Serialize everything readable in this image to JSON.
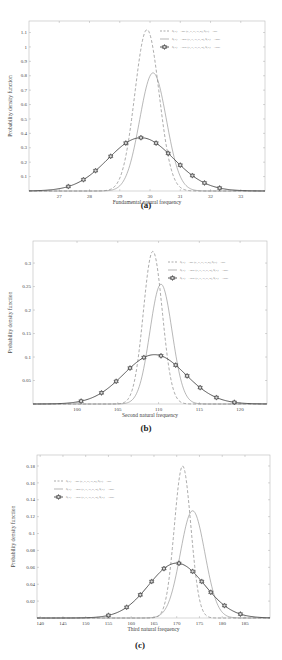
{
  "figure": {
    "panels": [
      {
        "caption": "(a)"
      },
      {
        "caption": "(b)"
      },
      {
        "caption": "(c)"
      }
    ]
  },
  "chart_data": [
    {
      "type": "line",
      "panel": "(a)",
      "title": "",
      "xlabel": "Fundamental natural frequency",
      "ylabel": "Probability density function",
      "xlim": [
        26.0,
        33.8
      ],
      "ylim": [
        0,
        1.18
      ],
      "xticks": [
        27,
        28,
        29,
        30,
        31,
        32,
        33
      ],
      "yticks": [
        0.1,
        0.2,
        0.3,
        0.4,
        0.5,
        0.6,
        0.7,
        0.8,
        0.9,
        1,
        1.1
      ],
      "grid": false,
      "legend_position": "upper right",
      "series": [
        {
          "name": "δ(X) = ±5% (E, E, G, G, ρ), δ(X) = ±5%",
          "style": "dashed",
          "mean": 29.9,
          "peak": 1.12,
          "x": [
            29.0,
            29.4,
            29.7,
            29.9,
            30.1,
            30.4,
            30.8
          ],
          "values": [
            0.06,
            0.53,
            1.0,
            1.12,
            1.0,
            0.53,
            0.06
          ]
        },
        {
          "name": "δ(X) = ±10% (E, E, G, G, ρ), δ(X) = ±10%",
          "style": "solid",
          "mean": 30.1,
          "peak": 0.82,
          "x": [
            28.9,
            29.5,
            29.8,
            30.1,
            30.4,
            30.7,
            31.3
          ],
          "values": [
            0.02,
            0.32,
            0.66,
            0.82,
            0.66,
            0.32,
            0.02
          ]
        },
        {
          "name": "δ(X) = ±15% (E, E, G, G, ρ), δ(X) = ±15%",
          "style": "solid-marker",
          "mean": 29.7,
          "peak": 0.37,
          "x": [
            27.3,
            27.8,
            28.2,
            28.7,
            29.2,
            29.7,
            30.2,
            30.6,
            31.0,
            31.4,
            31.8,
            32.3
          ],
          "values": [
            0.03,
            0.09,
            0.16,
            0.25,
            0.33,
            0.37,
            0.31,
            0.25,
            0.17,
            0.1,
            0.05,
            0.02
          ]
        }
      ]
    },
    {
      "type": "line",
      "panel": "(b)",
      "title": "",
      "xlabel": "Second natural frequency",
      "ylabel": "Probability density function",
      "xlim": [
        94.6,
        123.3
      ],
      "ylim": [
        0,
        0.347
      ],
      "xticks": [
        100,
        105,
        110,
        115,
        120
      ],
      "yticks": [
        0.05,
        0.1,
        0.15,
        0.2,
        0.25,
        0.3
      ],
      "grid": false,
      "legend_position": "upper right",
      "series": [
        {
          "name": "δ(X) = ±5% (E, E, G, G, ρ), δ(X) = ±5%",
          "style": "dashed",
          "mean": 109.3,
          "peak": 0.325,
          "x": [
            106,
            107.5,
            108.5,
            109.3,
            110.1,
            111.1,
            112.6
          ],
          "values": [
            0.01,
            0.1,
            0.25,
            0.325,
            0.25,
            0.1,
            0.01
          ]
        },
        {
          "name": "δ(X) = ±10% (E, E, G, G, ρ), δ(X) = ±10%",
          "style": "solid",
          "mean": 110.3,
          "peak": 0.255,
          "x": [
            106.3,
            108.2,
            109.3,
            110.3,
            111.3,
            112.4,
            114.3
          ],
          "values": [
            0.005,
            0.08,
            0.19,
            0.255,
            0.19,
            0.08,
            0.005
          ]
        },
        {
          "name": "δ(X) = ±15% (E, E, G, G, ρ), δ(X) = ±15%",
          "style": "solid-marker",
          "mean": 109.5,
          "peak": 0.105,
          "x": [
            100.5,
            103,
            104.8,
            106.5,
            108.2,
            110.3,
            112.1,
            113.5,
            115.1,
            117.1,
            119.3
          ],
          "values": [
            0.005,
            0.026,
            0.051,
            0.078,
            0.1,
            0.1,
            0.078,
            0.056,
            0.034,
            0.015,
            0.004
          ]
        }
      ]
    },
    {
      "type": "line",
      "panel": "(c)",
      "title": "",
      "xlabel": "Third natural frequency",
      "ylabel": "Probability density function",
      "xlim": [
        139.3,
        190.5
      ],
      "ylim": [
        0,
        0.193
      ],
      "xticks": [
        140,
        145,
        150,
        155,
        160,
        165,
        170,
        175,
        180,
        185
      ],
      "yticks": [
        0.02,
        0.04,
        0.06,
        0.08,
        0.1,
        0.12,
        0.14,
        0.16,
        0.18
      ],
      "grid": false,
      "legend_position": "upper left",
      "series": [
        {
          "name": "δ(X) = ±5% (E, E, G, G, ρ), δ(X) = ±5%",
          "style": "dashed",
          "mean": 171.3,
          "peak": 0.18,
          "x": [
            167,
            169.3,
            170.3,
            171.3,
            172.3,
            174.5,
            177.5
          ],
          "values": [
            0.01,
            0.08,
            0.15,
            0.18,
            0.15,
            0.06,
            0.005
          ]
        },
        {
          "name": "δ(X) = ±10% (E, E, G, G, ρ), δ(X) = ±10%",
          "style": "solid",
          "mean": 173.5,
          "peak": 0.127,
          "x": [
            166,
            169.5,
            171.5,
            173.5,
            175.5,
            177.5,
            181
          ],
          "values": [
            0.002,
            0.04,
            0.1,
            0.127,
            0.1,
            0.04,
            0.002
          ]
        },
        {
          "name": "δ(X) = ±15% (E, E, G, G, ρ), δ(X) = ±15%",
          "style": "solid-marker",
          "mean": 170.0,
          "peak": 0.065,
          "x": [
            155,
            159,
            162,
            164.5,
            167.2,
            170.5,
            173.5,
            175.5,
            177.5,
            180.5,
            184
          ],
          "values": [
            0.003,
            0.015,
            0.03,
            0.045,
            0.06,
            0.064,
            0.053,
            0.041,
            0.027,
            0.014,
            0.005
          ]
        }
      ]
    }
  ]
}
